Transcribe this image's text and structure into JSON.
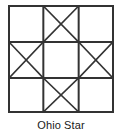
{
  "figure": {
    "caption": "Ohio Star",
    "block_name": "Ohio Star"
  },
  "diagram": {
    "type": "quilt-block-grid",
    "grid_rows": 3,
    "grid_cols": 3,
    "line_color": "#333333",
    "fill_color": "#ffffff",
    "background_color": "#ffffff",
    "outer_border_width": 2,
    "grid_line_width": 2,
    "diagonal_line_width": 1.6,
    "cells": [
      {
        "row": 0,
        "col": 0,
        "name": "top-left",
        "pattern": "plain"
      },
      {
        "row": 0,
        "col": 1,
        "name": "top-middle",
        "pattern": "quarter-square-triangles"
      },
      {
        "row": 0,
        "col": 2,
        "name": "top-right",
        "pattern": "plain"
      },
      {
        "row": 1,
        "col": 0,
        "name": "middle-left",
        "pattern": "quarter-square-triangles"
      },
      {
        "row": 1,
        "col": 1,
        "name": "center",
        "pattern": "plain"
      },
      {
        "row": 1,
        "col": 2,
        "name": "middle-right",
        "pattern": "quarter-square-triangles"
      },
      {
        "row": 2,
        "col": 0,
        "name": "bottom-left",
        "pattern": "plain"
      },
      {
        "row": 2,
        "col": 1,
        "name": "bottom-middle",
        "pattern": "quarter-square-triangles"
      },
      {
        "row": 2,
        "col": 2,
        "name": "bottom-right",
        "pattern": "plain"
      }
    ]
  }
}
